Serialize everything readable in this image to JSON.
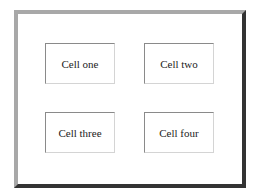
{
  "table": {
    "border_style": "outset",
    "cells": [
      {
        "label": "Cell one"
      },
      {
        "label": "Cell two"
      },
      {
        "label": "Cell three"
      },
      {
        "label": "Cell four"
      }
    ]
  },
  "colors": {
    "outer_border_light": "#a8a8a8",
    "outer_border_dark": "#333333",
    "cell_border_dark": "#8a8a8a",
    "cell_border_light": "#d4d4d4",
    "text": "#222222",
    "background": "#ffffff"
  }
}
